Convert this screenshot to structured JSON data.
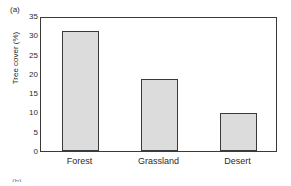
{
  "figure": {
    "panel_label": "(a)",
    "next_panel_label": "(b)"
  },
  "chart_data": {
    "type": "bar",
    "title": "",
    "xlabel": "",
    "ylabel": "Tree cover (%)",
    "categories": [
      "Forest",
      "Grassland",
      "Desert"
    ],
    "values": [
      31.0,
      18.8,
      9.8
    ],
    "ylim": [
      0,
      35
    ],
    "yticks": [
      0,
      5,
      10,
      15,
      20,
      25,
      30,
      35
    ],
    "ytick_labels": [
      "0",
      "5",
      "10",
      "15",
      "20",
      "25",
      "30",
      "35"
    ],
    "grid": false,
    "legend": null,
    "bar_fill_color": "#dcdcdc",
    "bar_edge_color": "#3a3a3a",
    "axis_color": "#3a3a3a"
  }
}
